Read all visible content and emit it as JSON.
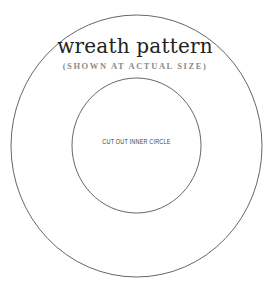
{
  "pattern": {
    "title": "wreath pattern",
    "subtitle": "(SHOWN AT ACTUAL SIZE)",
    "inner_label": "CUT OUT INNER CIRCLE"
  },
  "colors": {
    "line": "#555555",
    "title": "#222222",
    "subtitle": "#8a8a8a",
    "label": "#444444"
  }
}
